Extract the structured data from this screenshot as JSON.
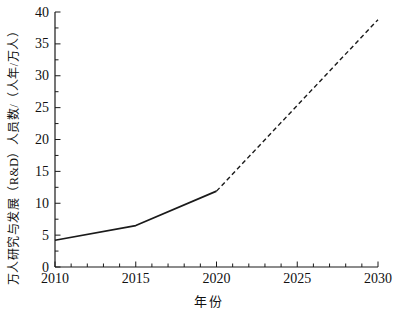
{
  "figure": {
    "background": "#ffffff"
  },
  "chart_data": {
    "type": "line",
    "title": "",
    "xlabel": "年份",
    "ylabel": "万人研究与发展（R&D）人员数/（人年/万人）",
    "xlim": [
      2010,
      2030
    ],
    "ylim": [
      0,
      40
    ],
    "x_major_ticks": [
      2010,
      2015,
      2020,
      2025,
      2030
    ],
    "x_minor_tick_step": 1,
    "y_major_ticks": [
      0,
      5,
      10,
      15,
      20,
      25,
      30,
      35,
      40
    ],
    "y_minor_tick_step": 2.5,
    "grid": false,
    "legend": false,
    "axis_color": "#1a1a1a",
    "line_color": "#1a1a1a",
    "series": [
      {
        "name": "observed-2010-2020",
        "style": "solid",
        "x": [
          2010,
          2015,
          2020
        ],
        "y": [
          4.2,
          6.5,
          11.9
        ]
      },
      {
        "name": "projected-2020-2030",
        "style": "dashed",
        "x": [
          2020,
          2030
        ],
        "y": [
          11.9,
          38.8
        ]
      }
    ]
  }
}
